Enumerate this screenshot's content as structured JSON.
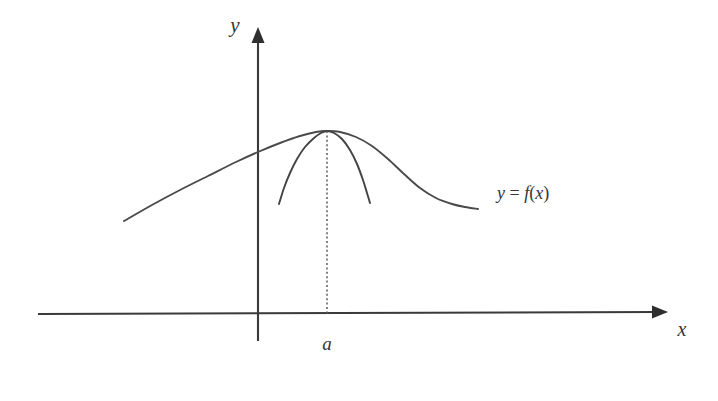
{
  "figure": {
    "kind": "math-graph",
    "background_color": "#ffffff",
    "ink_color": "#3a3a3a"
  },
  "axes": {
    "x_axis": {
      "label": "x",
      "label_x": 682,
      "label_y": 336,
      "start_x": 38,
      "start_y": 314,
      "end_x": 659,
      "end_y": 312,
      "arrow_tip_x": 668,
      "arrow_tip_y": 312
    },
    "y_axis": {
      "label": "y",
      "label_x": 235,
      "label_y": 32,
      "bottom_x": 258,
      "bottom_y": 341,
      "top_x": 258,
      "top_y": 40,
      "arrow_tip_x": 258,
      "arrow_tip_y": 27
    }
  },
  "annotations": {
    "function_label": {
      "full_text": "y = f(x)",
      "lhs": "y",
      "operator": " = ",
      "fn_name": "f",
      "open_paren": "(",
      "argument": "x",
      "close_paren": ")",
      "x": 497,
      "y": 199
    },
    "point_label": {
      "text": "a",
      "x": 327,
      "y": 350,
      "description": "abscissa of the common maximum"
    },
    "drop_line": {
      "from_x": 327,
      "from_y": 131,
      "to_x": 327,
      "to_y": 314,
      "style": "dotted"
    }
  },
  "chart_data": {
    "type": "line",
    "xlabel": "x",
    "ylabel": "y",
    "grid": false,
    "legend": "none",
    "annotations": [
      "y = f(x)",
      "a"
    ],
    "tick_labels": {
      "x": [
        "a"
      ],
      "y": []
    },
    "maximum_point": {
      "x": "a",
      "pixel_x": 327,
      "pixel_y": 131
    },
    "series": [
      {
        "name": "y = f(x)",
        "role": "outer-curve",
        "points": [
          [
            124,
            221
          ],
          [
            152,
            205
          ],
          [
            180,
            190
          ],
          [
            208,
            176
          ],
          [
            236,
            162
          ],
          [
            258,
            152
          ],
          [
            280,
            143
          ],
          [
            300,
            136
          ],
          [
            316,
            132
          ],
          [
            327,
            131
          ],
          [
            340,
            132
          ],
          [
            356,
            137
          ],
          [
            372,
            146
          ],
          [
            388,
            159
          ],
          [
            404,
            174
          ],
          [
            420,
            188
          ],
          [
            436,
            198
          ],
          [
            452,
            204
          ],
          [
            465,
            207
          ],
          [
            478,
            209
          ]
        ]
      },
      {
        "name": "inner comparison curve",
        "role": "inner-curve",
        "points": [
          [
            279,
            204
          ],
          [
            284,
            188
          ],
          [
            290,
            173
          ],
          [
            297,
            159
          ],
          [
            305,
            147
          ],
          [
            314,
            138
          ],
          [
            321,
            133
          ],
          [
            327,
            131
          ],
          [
            334,
            133
          ],
          [
            342,
            139
          ],
          [
            350,
            150
          ],
          [
            357,
            164
          ],
          [
            363,
            180
          ],
          [
            367,
            193
          ],
          [
            370,
            203
          ]
        ]
      }
    ]
  }
}
